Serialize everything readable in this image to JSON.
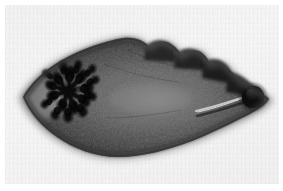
{
  "figure": {
    "kind": "photomicrograph",
    "subject_label": "flatworm-specimen",
    "caption": "",
    "background_color": "#f3f3f3",
    "plate_margin_color": "#ffffff"
  },
  "specimen": {
    "name": "trematode-whole-mount",
    "outline_color": "#2b2b2b",
    "body_fill_dark": "#1d1d1d",
    "body_fill_mid": "#4a4a4a",
    "body_fill_light": "#6e6e6e",
    "orientation": "horizontal",
    "anterior_end": "right",
    "posterior_end": "left",
    "extent_px": {
      "x_min": 22,
      "x_max": 270,
      "y_min": 37,
      "y_max": 157
    }
  },
  "structures": [
    {
      "id": "stained-organ",
      "label": "dark-branching-organ",
      "description": "densely stained rosette / branching gland mass",
      "color": "#0b0b0b",
      "center_px": {
        "x": 68,
        "y": 91
      },
      "size_px": {
        "w": 54,
        "h": 56
      }
    },
    {
      "id": "terminal-sucker",
      "label": "dark-round-sucker",
      "description": "round opaque sucker at anterior tip",
      "color": "#090909",
      "center_px": {
        "x": 253,
        "y": 97
      },
      "radius_px": 11
    },
    {
      "id": "canal",
      "label": "pale-canal-line",
      "description": "thin pale duct running from sucker toward body centre",
      "color": "#c9c9c9",
      "from_px": {
        "x": 196,
        "y": 110
      },
      "to_px": {
        "x": 246,
        "y": 96
      }
    },
    {
      "id": "lobed-margin",
      "label": "lobed-dorsal-margin",
      "description": "scalloped lobes along upper right border",
      "color": "#2a2a2a",
      "span_px": {
        "x_start": 150,
        "x_end": 235,
        "y": 52
      }
    },
    {
      "id": "median-field",
      "label": "pale-median-field",
      "description": "lighter granular midline zone of the body",
      "color": "#7a7a7a",
      "center_px": {
        "x": 160,
        "y": 100
      }
    },
    {
      "id": "posterior-tip",
      "label": "pointed-posterior-tip",
      "description": "pale pointed tail end at left",
      "color": "#8a8a8a",
      "tip_px": {
        "x": 23,
        "y": 97
      }
    }
  ],
  "annotations": {
    "scale_bar": "",
    "figure_number": "",
    "arrows": []
  }
}
